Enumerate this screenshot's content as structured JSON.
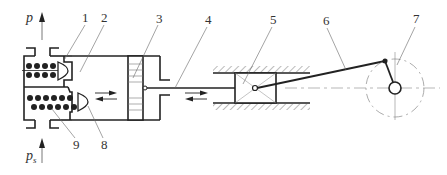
{
  "diagram": {
    "type": "reciprocating-compressor-schematic",
    "pressure_labels": {
      "discharge": "p",
      "suction": "p",
      "suction_subscript": "s"
    },
    "part_labels": [
      {
        "id": "1",
        "text": "1"
      },
      {
        "id": "2",
        "text": "2"
      },
      {
        "id": "3",
        "text": "3"
      },
      {
        "id": "4",
        "text": "4"
      },
      {
        "id": "5",
        "text": "5"
      },
      {
        "id": "6",
        "text": "6"
      },
      {
        "id": "7",
        "text": "7"
      },
      {
        "id": "8",
        "text": "8"
      },
      {
        "id": "9",
        "text": "9"
      }
    ],
    "components": {
      "1": "discharge valve",
      "2": "cylinder",
      "3": "piston",
      "4": "piston rod",
      "5": "crosshead",
      "6": "connecting rod",
      "7": "crankshaft",
      "8": "suction valve",
      "9": "valve spring"
    },
    "colors": {
      "line": "#222222",
      "thin": "#555555",
      "background": "#ffffff"
    }
  }
}
